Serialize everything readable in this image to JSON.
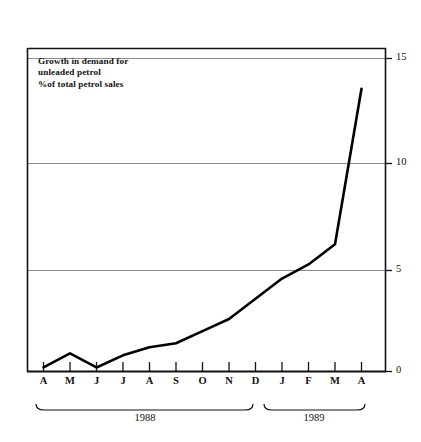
{
  "chart_data": {
    "type": "line",
    "title": "Growth in demand for unleaded petrol",
    "title_lines": [
      "Growth in demand for",
      "unleaded petrol",
      "%of total petrol sales"
    ],
    "subtitle": "%of total petrol sales",
    "xlabel": "",
    "ylabel": "",
    "categories": [
      "A",
      "M",
      "J",
      "J",
      "A",
      "S",
      "O",
      "N",
      "D",
      "J",
      "F",
      "M",
      "A"
    ],
    "x_tick_labels": [
      "A",
      "M",
      "J",
      "J",
      "A",
      "S",
      "O",
      "N",
      "D",
      "J",
      "F",
      "M",
      "A"
    ],
    "values": [
      0.2,
      0.9,
      0.2,
      0.8,
      1.2,
      1.4,
      2.0,
      2.6,
      3.6,
      4.6,
      5.3,
      6.3,
      14.0
    ],
    "ylim": [
      0,
      16.2
    ],
    "y_tick_labels": [
      "0",
      "5",
      "10",
      "15"
    ],
    "y_ticks": [
      0,
      5,
      10,
      15
    ],
    "grid": true,
    "legend": "none",
    "legend_position": "none",
    "line_color": "#000000",
    "grid_color": "#8c8c8c",
    "frame_color": "#000000",
    "background_color": "#ffffff",
    "period_brackets": [
      {
        "label": "1988",
        "start_index": 0,
        "end_index": 8
      },
      {
        "label": "1989",
        "start_index": 9,
        "end_index": 12
      }
    ]
  },
  "axis": {
    "y_labels": [
      "15",
      "10",
      "5",
      "0"
    ]
  },
  "periods": {
    "first": "1988",
    "second": "1989"
  }
}
